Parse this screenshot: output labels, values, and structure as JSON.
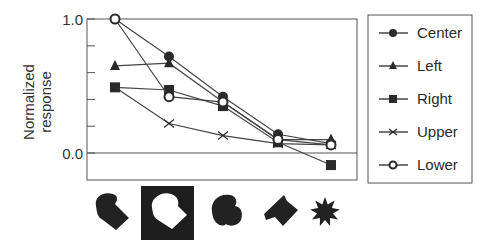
{
  "chart_data": {
    "type": "line",
    "title": "",
    "xlabel": "",
    "ylabel": "Normalized response",
    "ylim": [
      -0.2,
      1.0
    ],
    "yticks": [
      {
        "value": 1.0,
        "label": "1.0"
      },
      {
        "value": 0.8,
        "label": ""
      },
      {
        "value": 0.6,
        "label": ""
      },
      {
        "value": 0.4,
        "label": ""
      },
      {
        "value": 0.2,
        "label": ""
      },
      {
        "value": 0.0,
        "label": "0.0"
      }
    ],
    "x": [
      1,
      2,
      3,
      4,
      5
    ],
    "categories": [
      "shape-1",
      "shape-2 (highlighted)",
      "shape-3",
      "shape-4",
      "shape-5 (star)"
    ],
    "grid": false,
    "legend_position": "right",
    "series": [
      {
        "name": "Center",
        "marker": "filled-circle",
        "values": [
          1.0,
          0.72,
          0.42,
          0.14,
          0.07
        ]
      },
      {
        "name": "Left",
        "marker": "filled-triangle",
        "values": [
          0.65,
          0.67,
          0.38,
          0.1,
          0.1
        ]
      },
      {
        "name": "Right",
        "marker": "filled-square",
        "values": [
          0.49,
          0.47,
          0.35,
          0.08,
          -0.09
        ]
      },
      {
        "name": "Upper",
        "marker": "x",
        "values": [
          0.49,
          0.22,
          0.13,
          0.07,
          0.06
        ]
      },
      {
        "name": "Lower",
        "marker": "open-circle",
        "values": [
          1.0,
          0.42,
          0.38,
          0.1,
          0.06
        ]
      }
    ],
    "stimulus_icons": [
      {
        "name": "blob-shape-1",
        "highlighted": false
      },
      {
        "name": "blob-shape-2",
        "highlighted": true
      },
      {
        "name": "blob-shape-3",
        "highlighted": false
      },
      {
        "name": "wedge-shape-4",
        "highlighted": false
      },
      {
        "name": "star-shape-5",
        "highlighted": false
      }
    ]
  },
  "labels": {
    "ylabel_line1": "Normalized",
    "ylabel_line2": "response",
    "ytick_top": "1.0",
    "ytick_zero": "0.0",
    "legend": [
      "Center",
      "Left",
      "Right",
      "Upper",
      "Lower"
    ]
  },
  "colors": {
    "ink": "#2a2a2a",
    "axis": "#555555",
    "background": "#ffffff"
  }
}
